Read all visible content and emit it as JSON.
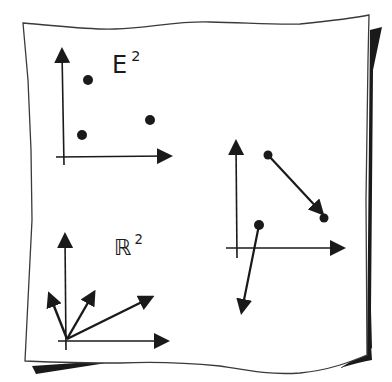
{
  "diagram": {
    "kind": "hand-drawn sketch on sheet of paper",
    "colors": {
      "ink": "#1a1a1a",
      "paper": "#ffffff",
      "shadow": "#1a1a1a"
    },
    "panels": [
      {
        "id": "euclidean-plane",
        "label": {
          "base": "E",
          "superscript": "2"
        },
        "description": "Axes with three isolated points",
        "points": [
          {
            "x": 88,
            "y": 80
          },
          {
            "x": 150,
            "y": 120
          },
          {
            "x": 82,
            "y": 135
          }
        ]
      },
      {
        "id": "vector-space",
        "label": {
          "base": "ℝ",
          "superscript": "2"
        },
        "description": "Axes with three vectors from the origin",
        "vectors_from_origin": 3
      },
      {
        "id": "affine-plane",
        "label": null,
        "description": "Axes with two free vectors, each starting at a dot",
        "free_vectors": 2
      }
    ]
  }
}
